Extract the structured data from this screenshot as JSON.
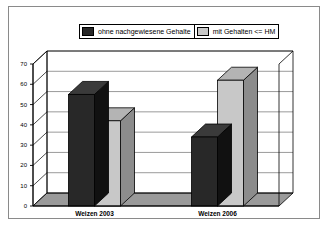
{
  "chart_data": {
    "type": "bar",
    "title": "",
    "xlabel": "",
    "ylabel": "Anteile (in %)",
    "categories": [
      "Weizen 2003",
      "Weizen 2006"
    ],
    "series": [
      {
        "name": "ohne nachgewiesene Gehalte",
        "color": "#282828",
        "values": [
          55,
          34
        ]
      },
      {
        "name": "mit Gehalten <= HM",
        "color": "#c8c8c8",
        "values": [
          42,
          62
        ]
      }
    ],
    "ylim": [
      0,
      70
    ],
    "yticks": [
      0,
      10,
      20,
      30,
      40,
      50,
      60,
      70
    ],
    "ytick_labels": [
      "0",
      "10",
      "20",
      "30",
      "40",
      "50",
      "60",
      "70"
    ],
    "grid": true,
    "legend_position": "top-center",
    "three_d": true,
    "annotations": []
  },
  "legend": {
    "entries": [
      {
        "label": "ohne nachgewiesene Gehalte",
        "swatch": "dark"
      },
      {
        "label": "mit Gehalten <= HM",
        "swatch": "light"
      }
    ]
  },
  "colors": {
    "series_dark": "#282828",
    "series_light": "#c8c8c8",
    "side_dark": "#111111",
    "top_dark": "#3a3a3a",
    "side_light": "#8c8c8c",
    "top_light": "#b4b4b4",
    "floor": "#9a9a9a",
    "grid": "#808080",
    "axis": "#000000",
    "frame": "#8a8a8a",
    "plot_bg": "#ffffff"
  }
}
